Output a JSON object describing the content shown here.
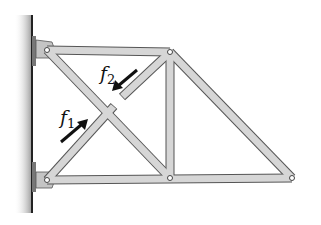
{
  "figure": {
    "type": "truss-diagram",
    "colors": {
      "member_fill": "#d6d6d6",
      "member_stroke": "#555555",
      "wall": "#222222",
      "arrow": "#111111",
      "background": "#ffffff"
    },
    "labels": {
      "f1": {
        "main": "f",
        "sub": "1"
      },
      "f2": {
        "main": "f",
        "sub": "2"
      }
    },
    "joints": [
      {
        "id": "A",
        "name": "top-left-pin",
        "x": 47,
        "y": 50
      },
      {
        "id": "B",
        "name": "bottom-left-pin",
        "x": 47,
        "y": 180
      },
      {
        "id": "C",
        "name": "top-right-joint",
        "x": 170,
        "y": 52
      },
      {
        "id": "D",
        "name": "bottom-middle-joint",
        "x": 170,
        "y": 178
      },
      {
        "id": "E",
        "name": "tip-joint",
        "x": 292,
        "y": 178
      }
    ],
    "members": [
      {
        "name": "top-chord",
        "from": "A",
        "to": "C"
      },
      {
        "name": "bottom-chord",
        "from": "B",
        "to": "E"
      },
      {
        "name": "vertical-member",
        "from": "C",
        "to": "D"
      },
      {
        "name": "diagonal-A-D",
        "from": "A",
        "to": "D"
      },
      {
        "name": "diagonal-B-C-cut",
        "from": "B",
        "to": "C",
        "cut": true
      },
      {
        "name": "diagonal-C-E",
        "from": "C",
        "to": "E"
      }
    ]
  }
}
